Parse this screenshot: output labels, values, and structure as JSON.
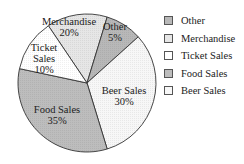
{
  "chart_data": {
    "type": "pie",
    "title": "",
    "slices": [
      {
        "label": "Merchandise",
        "display": [
          "Merchandise",
          "20%"
        ],
        "value": 20,
        "color": "#e6e6e6",
        "start": -34,
        "end": 17,
        "text_pos": [
          69,
          25
        ]
      },
      {
        "label": "Other",
        "display": [
          "Other",
          "5%"
        ],
        "value": 5,
        "color": "#b8b8b8",
        "start": 17,
        "end": 48,
        "text_pos": [
          115,
          30
        ]
      },
      {
        "label": "Beer Sales",
        "display": [
          "Beer Sales",
          "30%"
        ],
        "value": 30,
        "color": "#f7f7f7",
        "start": 48,
        "end": 163,
        "text_pos": [
          124,
          94
        ]
      },
      {
        "label": "Food Sales",
        "display": [
          "Food Sales",
          "35%"
        ],
        "value": 35,
        "color": "#bdbdbd",
        "start": 163,
        "end": 282,
        "text_pos": [
          57,
          113
        ]
      },
      {
        "label": "Ticket Sales",
        "display": [
          "Ticket",
          "Sales",
          "10%"
        ],
        "value": 10,
        "color": "#ffffff",
        "start": 282,
        "end": 326,
        "text_pos": [
          44,
          51
        ]
      }
    ],
    "legend": [
      {
        "label": "Other",
        "color": "#b8b8b8"
      },
      {
        "label": "Merchandise",
        "color": "#e6e6e6"
      },
      {
        "label": "Ticket Sales",
        "color": "#ffffff"
      },
      {
        "label": "Food Sales",
        "color": "#bdbdbd"
      },
      {
        "label": "Beer Sales",
        "color": "#f7f7f7"
      }
    ],
    "legend_position": "right",
    "center": [
      87,
      83
    ],
    "radius": 69
  }
}
